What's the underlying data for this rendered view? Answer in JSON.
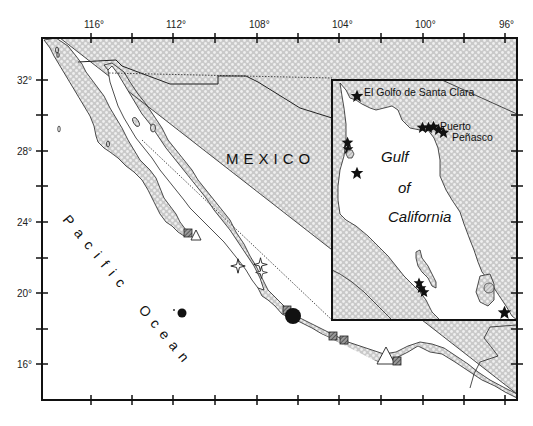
{
  "map": {
    "axes": {
      "x_tick_labels": [
        "116°",
        "112°",
        "108°",
        "104°",
        "100°",
        "96°"
      ],
      "y_tick_labels": [
        "32°",
        "28°",
        "24°",
        "20°",
        "16°"
      ]
    },
    "labels": {
      "country": "MEXICO",
      "ocean_word1": "Pacific",
      "ocean_word2": "Ocean"
    },
    "inset": {
      "title_line1": "Gulf",
      "title_line2": "of",
      "title_line3": "California",
      "place1": "El Golfo de Santa Clara",
      "place2_line1": "Puerto",
      "place2_line2": "Peñasco"
    },
    "colors": {
      "land_fill": "#c8c8c8",
      "land_dot": "#ececec",
      "frame": "#111111",
      "marker_hatch": "#555555"
    },
    "markers": [
      {
        "type": "hatched-square",
        "count": 6
      },
      {
        "type": "open-triangle",
        "count": 2
      },
      {
        "type": "filled-circle",
        "count": 2
      },
      {
        "type": "open-four-point-star",
        "count": 3
      },
      {
        "type": "filled-star",
        "count": 14
      },
      {
        "type": "hatched-hexagon",
        "count": 2
      }
    ]
  }
}
